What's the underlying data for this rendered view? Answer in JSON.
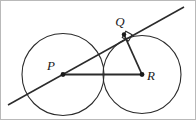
{
  "figure": {
    "background_color": "#ffffff",
    "stroke_color": "#2b2b2b",
    "label_color": "#1a1a1a",
    "border_color": "#b9b9b9",
    "width": 196,
    "height": 120,
    "labels": {
      "p": "P",
      "q": "Q",
      "r": "R"
    },
    "points": {
      "p": {
        "x": 62,
        "y": 73.5
      },
      "q": {
        "x": 123,
        "y": 33.5
      },
      "r": {
        "x": 141,
        "y": 73.5
      }
    },
    "label_positions": {
      "p": {
        "x": 50,
        "y": 69
      },
      "q": {
        "x": 114,
        "y": 25
      },
      "r": {
        "x": 147,
        "y": 79
      }
    },
    "circles": [
      {
        "name": "circle-p",
        "cx": 62,
        "cy": 73.5,
        "r": 41
      },
      {
        "name": "circle-r",
        "cx": 141,
        "cy": 73.5,
        "r": 39
      }
    ],
    "tangent_line": {
      "x1": 7,
      "y1": 104,
      "x2": 183,
      "y2": 6
    },
    "radius_segments": [
      {
        "name": "segment-pr",
        "x1": 62,
        "y1": 73.5,
        "x2": 141,
        "y2": 73.5
      },
      {
        "name": "segment-qr",
        "x1": 123,
        "y1": 33.5,
        "x2": 141,
        "y2": 73.5
      }
    ],
    "right_angle_marker": {
      "at": "Q",
      "path": "M 124.8 30.2 L 131.1 33.7 L 127.6 40.0 L 121.3 36.5 Z"
    },
    "center_dots": [
      {
        "name": "dot-p",
        "cx": 62,
        "cy": 73.5,
        "r": 2.4
      },
      {
        "name": "dot-q",
        "cx": 123,
        "cy": 33.5,
        "r": 2.2
      },
      {
        "name": "dot-r",
        "cx": 141,
        "cy": 73.5,
        "r": 2.4
      }
    ]
  }
}
